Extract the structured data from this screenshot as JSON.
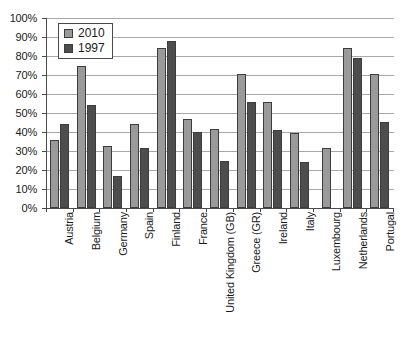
{
  "chart_data": {
    "type": "bar",
    "title": "",
    "xlabel": "",
    "ylabel": "",
    "ylim": [
      0,
      100
    ],
    "grid": true,
    "legend_position": "top-left",
    "categories": [
      "Austria",
      "Belgium",
      "Germany",
      "Spain",
      "Finland",
      "France",
      "United Kingdom (GB)",
      "Greece (GR)",
      "Ireland",
      "Italy",
      "Luxembourg",
      "Netherlands",
      "Portugal"
    ],
    "ytick_labels": [
      "0%",
      "10%",
      "20%",
      "30%",
      "40%",
      "50%",
      "60%",
      "70%",
      "80%",
      "90%",
      "100%"
    ],
    "ytick_values": [
      0,
      10,
      20,
      30,
      40,
      50,
      60,
      70,
      80,
      90,
      100
    ],
    "series": [
      {
        "name": "2010",
        "color": "#9a9a9a",
        "values": [
          36,
          75,
          32.5,
          44,
          84,
          47,
          41.5,
          70.5,
          56,
          39.5,
          31.5,
          84,
          70.5
        ]
      },
      {
        "name": "1997",
        "color": "#4d4d4d",
        "values": [
          44,
          54,
          17,
          31.5,
          88,
          40,
          24.5,
          56,
          41,
          24,
          null,
          79,
          45.5
        ]
      }
    ]
  }
}
